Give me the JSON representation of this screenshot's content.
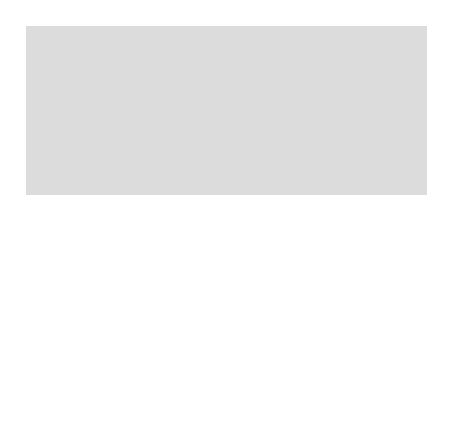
{
  "map": {
    "title_regions": {
      "north_carolina": "NORTH CAROLINA",
      "back_country": "BACK COUNTRY",
      "georgia": "GEORGIA",
      "atlantic_ocean": "ATLANTIC OCEAN"
    },
    "rivers": {
      "savannah_river": "Savannah River",
      "santee_river": "Santee River"
    },
    "parishes": [
      {
        "id": "st-david",
        "label": "St. David"
      },
      {
        "id": "st-mark",
        "label": "St. Mark"
      },
      {
        "id": "prince-george",
        "label": "Prince George"
      },
      {
        "id": "prince-frederick",
        "label": "Prince Frederick"
      },
      {
        "id": "all-saints",
        "label": "All Saint's"
      },
      {
        "id": "st-matthew",
        "label": "St. Matthew"
      },
      {
        "id": "st-stephen",
        "label": "St. Stephen"
      },
      {
        "id": "st-john-berkeley-1",
        "label": "St."
      },
      {
        "id": "st-john-berkeley-2",
        "label": "John Berkeley"
      },
      {
        "id": "st-james",
        "label": "St. James"
      },
      {
        "id": "goose-creek",
        "label": "Goose Creek"
      },
      {
        "id": "st-george",
        "label": "St. George"
      },
      {
        "id": "st-bartholomew",
        "label": "St. Bartholomew"
      },
      {
        "id": "prince-william",
        "label": "Prince William"
      },
      {
        "id": "st-peter",
        "label": "St. Peter"
      },
      {
        "id": "st-luke",
        "label": "St. Luke"
      },
      {
        "id": "st-paul",
        "label": "St. Paul"
      },
      {
        "id": "st-james-santee-1",
        "label": "St. James"
      },
      {
        "id": "st-james-santee-2",
        "label": "Santee"
      },
      {
        "id": "st-thomas-1",
        "label": "St. Thomas"
      },
      {
        "id": "st-thomas-2",
        "label": "& St. Dennis"
      },
      {
        "id": "christ-church",
        "label": "Christ Church"
      },
      {
        "id": "st-andrew",
        "label": "St. Andrew"
      },
      {
        "id": "st-john-colleton",
        "label": "St. John Colleton"
      },
      {
        "id": "st-helena",
        "label": "St. Helena"
      }
    ],
    "towns": {
      "georgetown": "Georgetown",
      "charles_town": "Charles Town",
      "beaufort": "Beaufort",
      "savannah": "Savannah"
    },
    "compass": {
      "north": "N"
    },
    "scale": {
      "title": "miles (approximate)",
      "ticks": [
        "0",
        "10",
        "20",
        "30",
        "40",
        "50"
      ]
    },
    "colors": {
      "sc_land": "#ffffff",
      "neighbor_land": "#dcdcdc",
      "ocean": "#a9a9a9",
      "border": "#555555",
      "frame": "#777777"
    }
  }
}
